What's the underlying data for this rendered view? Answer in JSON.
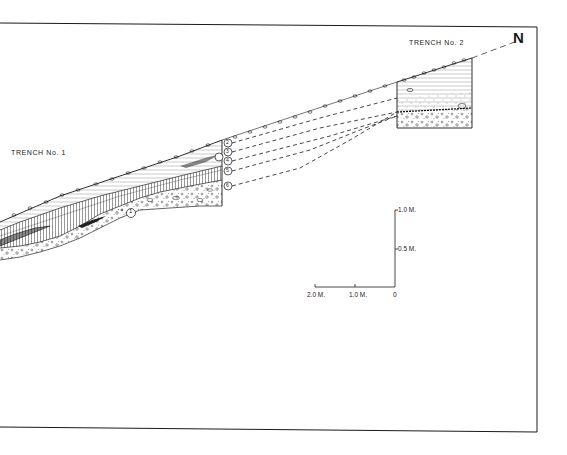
{
  "figure": {
    "type": "archaeological stratigraphic section",
    "north_marker": "N",
    "trenches": [
      {
        "id": "trench-1",
        "label": "TRENCH No. 1"
      },
      {
        "id": "trench-2",
        "label": "TRENCH No. 2"
      }
    ],
    "layers": [
      {
        "number": "1",
        "symbol": "①"
      },
      {
        "number": "2",
        "symbol": "②"
      },
      {
        "number": "3",
        "symbol": "③"
      },
      {
        "number": "4",
        "symbol": "④"
      },
      {
        "number": "5",
        "symbol": "⑤"
      },
      {
        "number": "6",
        "symbol": "⑥"
      }
    ],
    "scale_bar": {
      "horizontal_labels": [
        "2.0 M.",
        "1.0 M.",
        "0"
      ],
      "vertical_labels": [
        "1.0 M.",
        "0.5 M."
      ]
    }
  },
  "colors": {
    "ink": "#1a1a1a",
    "paper": "#ffffff"
  }
}
